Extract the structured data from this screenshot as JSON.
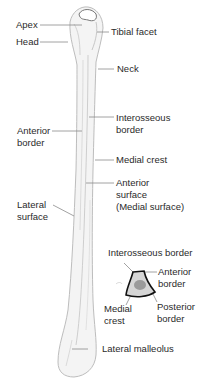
{
  "diagram": {
    "labels": {
      "apex": "Apex",
      "head": "Head",
      "tibial_facet": "Tibial facet",
      "neck": "Neck",
      "interosseous_border": [
        "Interosseous",
        "border"
      ],
      "anterior_border": [
        "Anterior",
        "border"
      ],
      "medial_crest": "Medial crest",
      "anterior_surface": [
        "Anterior",
        "surface",
        "(Medial surface)"
      ],
      "lateral_surface": [
        "Lateral",
        "surface"
      ],
      "lateral_malleolus": "Lateral malleolus"
    },
    "cross_section": {
      "interosseous_border": "Interosseous border",
      "anterior_border": [
        "Anterior",
        "border"
      ],
      "medial_crest": [
        "Medial",
        "crest"
      ],
      "posterior_border": [
        "Posterior",
        "border"
      ]
    },
    "colors": {
      "bone_fill": "#f4f4f4",
      "bone_outline": "#b8b8b8",
      "leader_line": "#8a8a8a",
      "section_outline": "#111111",
      "section_fill": "#d6d6d6",
      "marrow_fill": "#9a9a9a"
    }
  }
}
